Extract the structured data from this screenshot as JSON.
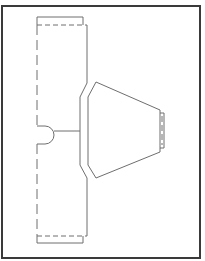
{
  "diagram": {
    "type": "sewing-pattern-layout",
    "colors": {
      "background": "#ffffff",
      "frame": "#3a3a3a",
      "line": "#6e6e6e"
    },
    "pieces": [
      {
        "id": "left-panel",
        "description": "tall vertical panel with dashed fold line on left edge, top and bottom hem tabs, semicircular notch"
      },
      {
        "id": "right-trapezoid",
        "description": "trapezoid piece with beveled left edge and small tab on the right"
      }
    ]
  }
}
